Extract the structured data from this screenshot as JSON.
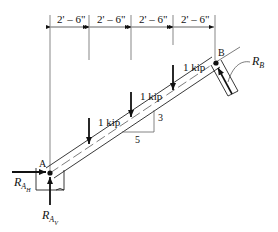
{
  "diagram": {
    "type": "free-body-diagram",
    "dimensions": [
      {
        "label": "2' – 6\""
      },
      {
        "label": "2' – 6\""
      },
      {
        "label": "2' – 6\""
      },
      {
        "label": "2' – 6\""
      }
    ],
    "loads": [
      {
        "label": "1 kip"
      },
      {
        "label": "1 kip"
      },
      {
        "label": "1 kip"
      }
    ],
    "points": {
      "a": "A",
      "b": "B"
    },
    "slope": {
      "rise": "3",
      "run": "5"
    },
    "reactions": {
      "rah": {
        "main": "R",
        "sub": "A",
        "subsub": "H"
      },
      "rav": {
        "main": "R",
        "sub": "A",
        "subsub": "V"
      },
      "rb": {
        "main": "R",
        "sub": "B"
      }
    }
  }
}
